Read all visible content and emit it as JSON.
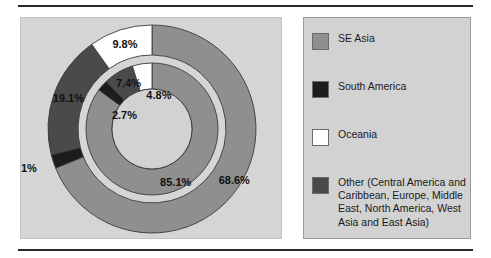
{
  "figure": {
    "background": "#ffffff",
    "plot_background": "#d5d5d5",
    "legend_background": "#d2d2d2",
    "rule_color": "#2a2a2a"
  },
  "colors": {
    "se_asia": "#8f8f8f",
    "south_america": "#1c1c1c",
    "oceania": "#ffffff",
    "other": "#4a4a4a",
    "hole": "#d2d2d2",
    "segment_outline": "#3a3a3a"
  },
  "legend": {
    "items": [
      {
        "label": "SE Asia",
        "color": "#8f8f8f",
        "swatch_name": "legend-swatch-se-asia"
      },
      {
        "label": "South America",
        "color": "#1c1c1c",
        "swatch_name": "legend-swatch-south-america"
      },
      {
        "label": "Oceania",
        "color": "#ffffff",
        "swatch_name": "legend-swatch-oceania"
      },
      {
        "label": "Other  (Central America and Caribbean, Europe, Middle East, North America, West Asia and East Asia)",
        "color": "#4a4a4a",
        "swatch_name": "legend-swatch-other"
      }
    ]
  },
  "chart_data": {
    "type": "pie",
    "title": "",
    "subtitle": "",
    "xlabel": "",
    "ylabel": "",
    "legend_position": "right",
    "grid": false,
    "categories": [
      "SE Asia",
      "South America",
      "Oceania",
      "Other"
    ],
    "rings": [
      {
        "name": "outer",
        "slices": [
          {
            "category": "SE Asia",
            "value": 68.6,
            "label": "68.6%",
            "color": "#8f8f8f"
          },
          {
            "category": "South America",
            "value": 2.1,
            "label": "2.1%",
            "color": "#1c1c1c"
          },
          {
            "category": "Other",
            "value": 19.1,
            "label": "19.1%",
            "color": "#4a4a4a"
          },
          {
            "category": "Oceania",
            "value": 9.8,
            "label": "9.8%",
            "color": "#ffffff"
          }
        ]
      },
      {
        "name": "inner",
        "slices": [
          {
            "category": "SE Asia",
            "value": 85.1,
            "label": "85.1%",
            "color": "#8f8f8f"
          },
          {
            "category": "South America",
            "value": 2.7,
            "label": "2.7%",
            "color": "#1c1c1c"
          },
          {
            "category": "Other",
            "value": 7.4,
            "label": "7.4%",
            "color": "#4a4a4a"
          },
          {
            "category": "Oceania",
            "value": 4.8,
            "label": "4.8%",
            "color": "#ffffff"
          }
        ]
      }
    ],
    "series": [
      {
        "name": "outer",
        "values": [
          68.6,
          2.1,
          19.1,
          9.8
        ]
      },
      {
        "name": "inner",
        "values": [
          85.1,
          2.7,
          7.4,
          4.8
        ]
      }
    ],
    "annotations": [
      {
        "text": "68.6%",
        "ring": "outer",
        "category": "SE Asia"
      },
      {
        "text": "2.1%",
        "ring": "outer",
        "category": "South America"
      },
      {
        "text": "19.1%",
        "ring": "outer",
        "category": "Other"
      },
      {
        "text": "9.8%",
        "ring": "outer",
        "category": "Oceania"
      },
      {
        "text": "85.1%",
        "ring": "inner",
        "category": "SE Asia"
      },
      {
        "text": "2.7%",
        "ring": "inner",
        "category": "South America"
      },
      {
        "text": "7.4%",
        "ring": "inner",
        "category": "Other"
      },
      {
        "text": "4.8%",
        "ring": "inner",
        "category": "Oceania"
      }
    ]
  },
  "labels": {
    "outer": {
      "se_asia": "68.6%",
      "south_america": "2.1%",
      "other": "19.1%",
      "oceania": "9.8%"
    },
    "inner": {
      "se_asia": "85.1%",
      "south_america": "2.7%",
      "other": "7.4%",
      "oceania": "4.8%"
    }
  }
}
